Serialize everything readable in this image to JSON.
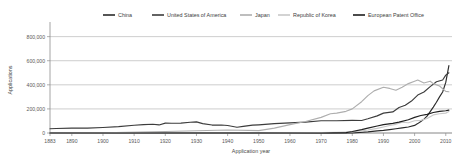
{
  "chart_data": {
    "type": "line",
    "title": "",
    "xlabel": "Application year",
    "ylabel": "Applications",
    "xlim": [
      1883,
      2012
    ],
    "ylim": [
      0,
      880000
    ],
    "grid": "horizontal",
    "legend_position": "top",
    "ytick_labels": [
      "0",
      "200,000",
      "400,000",
      "600,000",
      "800,000"
    ],
    "ytick_values": [
      0,
      200000,
      400000,
      600000,
      800000
    ],
    "xtick_labels": [
      "1883",
      "1890",
      "1900",
      "1910",
      "1920",
      "1930",
      "1940",
      "1950",
      "1960",
      "1970",
      "1980",
      "1990",
      "2000",
      "2010"
    ],
    "xtick_values": [
      1883,
      1890,
      1900,
      1910,
      1920,
      1930,
      1940,
      1950,
      1960,
      1970,
      1980,
      1990,
      2000,
      2010
    ],
    "series": [
      {
        "name": "China",
        "color": "#2b2b2b",
        "width": 1.15,
        "x": [
          1883,
          1900,
          1920,
          1940,
          1950,
          1960,
          1970,
          1980,
          1985,
          1988,
          1990,
          1992,
          1994,
          1996,
          1998,
          2000,
          2001,
          2002,
          2003,
          2004,
          2005,
          2006,
          2007,
          2008,
          2009,
          2010,
          2011
        ],
        "values": [
          0,
          0,
          0,
          0,
          0,
          0,
          0,
          0,
          9000,
          18000,
          22000,
          28000,
          35000,
          42000,
          50000,
          63000,
          78000,
          96000,
          115000,
          140000,
          178000,
          215000,
          255000,
          300000,
          340000,
          420000,
          560000
        ]
      },
      {
        "name": "United States of America",
        "color": "#3c3c3c",
        "width": 1.15,
        "x": [
          1883,
          1885,
          1890,
          1895,
          1900,
          1905,
          1910,
          1913,
          1916,
          1918,
          1920,
          1922,
          1925,
          1928,
          1930,
          1932,
          1935,
          1938,
          1940,
          1943,
          1945,
          1948,
          1950,
          1955,
          1960,
          1965,
          1970,
          1975,
          1980,
          1983,
          1985,
          1988,
          1990,
          1993,
          1995,
          1997,
          1999,
          2001,
          2003,
          2005,
          2007,
          2009,
          2010,
          2011
        ],
        "values": [
          35000,
          37000,
          41000,
          40000,
          46000,
          53000,
          64000,
          70000,
          73000,
          67000,
          82000,
          81000,
          82000,
          89000,
          92000,
          78000,
          66000,
          66000,
          62000,
          48000,
          55000,
          65000,
          68000,
          78000,
          84000,
          90000,
          102000,
          102000,
          105000,
          104000,
          118000,
          142000,
          165000,
          175000,
          212000,
          230000,
          265000,
          315000,
          340000,
          385000,
          425000,
          440000,
          480000,
          500000
        ]
      },
      {
        "name": "Japan",
        "color": "#aeaeae",
        "width": 1.15,
        "x": [
          1883,
          1900,
          1920,
          1940,
          1950,
          1955,
          1960,
          1965,
          1970,
          1973,
          1975,
          1978,
          1980,
          1983,
          1985,
          1987,
          1990,
          1992,
          1994,
          1996,
          1998,
          2000,
          2001,
          2003,
          2005,
          2006,
          2008,
          2010,
          2011
        ],
        "values": [
          0,
          2000,
          12000,
          25000,
          20000,
          40000,
          70000,
          95000,
          130000,
          160000,
          165000,
          180000,
          200000,
          260000,
          310000,
          350000,
          380000,
          370000,
          355000,
          380000,
          410000,
          430000,
          440000,
          415000,
          430000,
          410000,
          390000,
          345000,
          342000
        ]
      },
      {
        "name": "Republic of Korea",
        "color": "#c9c9c9",
        "width": 1.15,
        "x": [
          1883,
          1950,
          1960,
          1970,
          1975,
          1980,
          1983,
          1985,
          1988,
          1990,
          1992,
          1994,
          1996,
          1998,
          2000,
          2002,
          2004,
          2006,
          2008,
          2010,
          2011
        ],
        "values": [
          0,
          0,
          1000,
          3000,
          6000,
          10000,
          18000,
          25000,
          38000,
          50000,
          62000,
          72000,
          90000,
          85000,
          102000,
          105000,
          120000,
          150000,
          160000,
          165000,
          178000
        ]
      },
      {
        "name": "European Patent Office",
        "color": "#1f1f1f",
        "width": 1.15,
        "x": [
          1883,
          1950,
          1970,
          1978,
          1980,
          1983,
          1985,
          1988,
          1990,
          1993,
          1995,
          1998,
          2000,
          2002,
          2004,
          2006,
          2008,
          2010,
          2011
        ],
        "values": [
          0,
          0,
          0,
          3000,
          12000,
          28000,
          40000,
          58000,
          70000,
          80000,
          90000,
          110000,
          130000,
          145000,
          155000,
          170000,
          180000,
          185000,
          190000
        ]
      }
    ]
  },
  "legend": {
    "items": [
      {
        "label": "China"
      },
      {
        "label": "United States of America"
      },
      {
        "label": "Japan"
      },
      {
        "label": "Republic of Korea"
      },
      {
        "label": "European Patent Office"
      }
    ]
  }
}
